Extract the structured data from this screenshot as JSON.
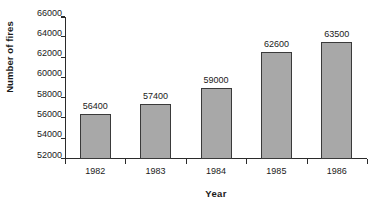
{
  "chart_data": {
    "type": "bar",
    "title": "",
    "xlabel": "Year",
    "ylabel": "Number of fires",
    "categories": [
      "1982",
      "1983",
      "1984",
      "1985",
      "1986"
    ],
    "values": [
      56400,
      57400,
      59000,
      62600,
      63500
    ],
    "data_labels": [
      "56400",
      "57400",
      "59000",
      "62600",
      "63500"
    ],
    "series": [
      {
        "name": "Number of fires",
        "values": [
          56400,
          57400,
          59000,
          62600,
          63500
        ]
      }
    ],
    "ylim": [
      52000,
      66000
    ],
    "ytick_values": [
      52000,
      54000,
      56000,
      58000,
      60000,
      62000,
      64000,
      66000
    ],
    "ytick_labels": [
      "52000",
      "54000",
      "56000",
      "58000",
      "60000",
      "62000",
      "64000",
      "66000"
    ],
    "ytick_step": 2000,
    "grid": false,
    "legend": false,
    "legend_position": "none",
    "bar_fill_color": "#a8a8a8",
    "bar_border_color": "#3a3a3a",
    "axis_color": "#2b2b2b",
    "background_color": "#ffffff",
    "text_color": "#1a1a1a"
  }
}
